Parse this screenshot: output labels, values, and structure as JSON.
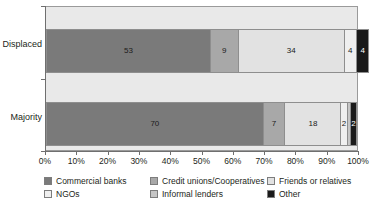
{
  "chart_data": {
    "type": "bar",
    "orientation": "horizontal",
    "stacked": true,
    "normalized": "100%",
    "title": "",
    "xlabel": "",
    "ylabel": "",
    "xlim": [
      0,
      100
    ],
    "grid": false,
    "legend_position": "bottom",
    "categories": [
      "Displaced",
      "Majority"
    ],
    "tick_labels": [
      "0%",
      "10%",
      "20%",
      "30%",
      "40%",
      "50%",
      "60%",
      "70%",
      "80%",
      "90%",
      "100%"
    ],
    "tick_values": [
      0,
      10,
      20,
      30,
      40,
      50,
      60,
      70,
      80,
      90,
      100
    ],
    "series": [
      {
        "name": "Commercial banks",
        "color": "#7a7a7a",
        "values": [
          53,
          70
        ],
        "labels": [
          "53",
          "70"
        ],
        "label_color": [
          "#1a1a1a",
          "#1a1a1a"
        ]
      },
      {
        "name": "Credit unions/Cooperatives",
        "color": "#a8a8a8",
        "values": [
          9,
          7
        ],
        "labels": [
          "9",
          "7"
        ],
        "label_color": [
          "#1a1a1a",
          "#1a1a1a"
        ]
      },
      {
        "name": "Friends or relatives",
        "color": "#e2e2e2",
        "values": [
          34,
          18
        ],
        "labels": [
          "34",
          "18"
        ],
        "label_color": [
          "#1a1a1a",
          "#1a1a1a"
        ]
      },
      {
        "name": "NGOs",
        "color": "#efefef",
        "values": [
          4,
          2
        ],
        "labels": [
          "4",
          "2"
        ],
        "label_color": [
          "#1a1a1a",
          "#1a1a1a"
        ]
      },
      {
        "name": "Informal lenders",
        "color": "#c6c6c6",
        "values": [
          0,
          1
        ],
        "labels": [
          "",
          ""
        ],
        "label_color": [
          "#1a1a1a",
          "#1a1a1a"
        ]
      },
      {
        "name": "Other",
        "color": "#1a1a1a",
        "values": [
          4,
          2
        ],
        "labels": [
          "4",
          "2"
        ],
        "label_color": [
          "#ffffff",
          "#ffffff"
        ]
      }
    ]
  },
  "legend": {
    "items": [
      {
        "label": "Commercial banks",
        "color": "#7a7a7a"
      },
      {
        "label": "Credit unions/Cooperatives",
        "color": "#a8a8a8"
      },
      {
        "label": "Friends or relatives",
        "color": "#e2e2e2"
      },
      {
        "label": "NGOs",
        "color": "#efefef"
      },
      {
        "label": "Informal lenders",
        "color": "#c6c6c6"
      },
      {
        "label": "Other",
        "color": "#1a1a1a"
      }
    ]
  },
  "axis": {
    "y_labels": [
      "Displaced",
      "Majority"
    ],
    "x_labels": [
      "0%",
      "10%",
      "20%",
      "30%",
      "40%",
      "50%",
      "60%",
      "70%",
      "80%",
      "90%",
      "100%"
    ]
  },
  "colors": {
    "plot_background": "#e9e9e9",
    "axis_line": "#6f6f6f",
    "border": "#9a9a9a",
    "text": "#231f20"
  }
}
